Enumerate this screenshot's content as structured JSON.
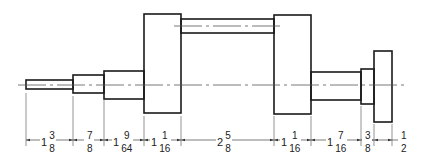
{
  "colors": {
    "line": "#1a1a1a",
    "dim_line": "#555555",
    "background": "#ffffff"
  },
  "dimensions": [
    {
      "whole": "1",
      "num": "3",
      "den": "8",
      "x1": 26,
      "x2": 73
    },
    {
      "whole": "",
      "num": "7",
      "den": "8",
      "x1": 73,
      "x2": 104
    },
    {
      "whole": "1",
      "num": "9",
      "den": "64",
      "x1": 104,
      "x2": 144
    },
    {
      "whole": "1",
      "num": "1",
      "den": "16",
      "x1": 144,
      "x2": 181
    },
    {
      "whole": "2",
      "num": "5",
      "den": "8",
      "x1": 181,
      "x2": 274
    },
    {
      "whole": "1",
      "num": "1",
      "den": "16",
      "x1": 274,
      "x2": 311
    },
    {
      "whole": "1",
      "num": "7",
      "den": "16",
      "x1": 311,
      "x2": 361
    },
    {
      "whole": "",
      "num": "3",
      "den": "8",
      "x1": 361,
      "x2": 374
    },
    {
      "whole": "",
      "num": "1",
      "den": "2",
      "x1": 374,
      "x2": 392
    }
  ]
}
